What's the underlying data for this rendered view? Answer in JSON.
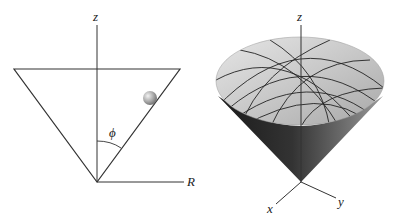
{
  "figure": {
    "left_panel": {
      "description": "Cross-section of a conical surface with a ball on its inner wall",
      "labels": {
        "z_axis": "z",
        "r_axis": "R",
        "angle": "ϕ"
      }
    },
    "right_panel": {
      "description": "3D cone surface with grid curves",
      "labels": {
        "z_axis": "z",
        "x_axis": "x",
        "y_axis": "y"
      }
    }
  },
  "colors": {
    "line": "#333333",
    "cone_light": "#d8d8d8",
    "cone_dark": "#2a2a2a",
    "ball": "#9a9a9a"
  }
}
